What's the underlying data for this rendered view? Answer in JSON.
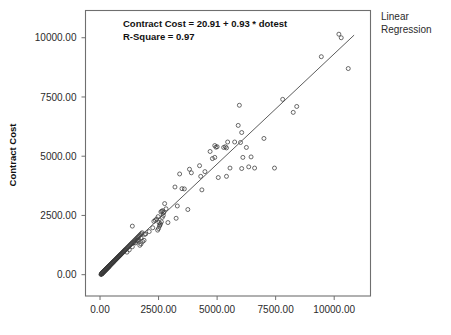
{
  "figure": {
    "background_color": "#ffffff",
    "frame_color": "#6f6f6f",
    "marker_color": "#3a3a3a",
    "line_color": "#4a4a4a"
  },
  "legend": {
    "line1": "Linear",
    "line2": "Regression"
  },
  "annotation": {
    "line1": "Contract Cost = 20.91 + 0.93 * dotest",
    "line2": "R-Square = 0.97"
  },
  "axes": {
    "y_title": "Contract Cost",
    "x_title": "",
    "y_ticks": [
      "0.00",
      "2500.00",
      "5000.00",
      "7500.00",
      "10000.00"
    ],
    "x_ticks": [
      "0.00",
      "2500.00",
      "5000.00",
      "7500.00",
      "10000.00"
    ]
  },
  "chart_data": {
    "type": "scatter",
    "title": "",
    "subtitle": "",
    "xlabel": "",
    "ylabel": "Contract Cost",
    "xlim": [
      -620,
      11550
    ],
    "ylim": [
      -900,
      11150
    ],
    "grid": false,
    "legend_position": "right-top",
    "annotations": [
      "Contract Cost = 20.91 + 0.93 * dotest",
      "R-Square = 0.97"
    ],
    "x_ticks": [
      0,
      2500,
      5000,
      7500,
      10000
    ],
    "y_ticks": [
      0,
      2500,
      5000,
      7500,
      10000
    ],
    "fit": {
      "name": "Linear Regression",
      "intercept": 20.91,
      "slope": 0.93,
      "r_square": 0.97,
      "x_start": 0,
      "x_end": 10850
    },
    "series": [
      {
        "name": "Contract Cost vs dotest",
        "marker": "open-circle",
        "x": [
          40,
          55,
          60,
          70,
          75,
          80,
          85,
          90,
          95,
          100,
          105,
          110,
          115,
          120,
          125,
          130,
          135,
          140,
          145,
          150,
          155,
          160,
          165,
          170,
          175,
          180,
          185,
          190,
          195,
          200,
          205,
          210,
          215,
          220,
          225,
          230,
          235,
          240,
          245,
          250,
          255,
          260,
          265,
          270,
          275,
          280,
          285,
          290,
          295,
          300,
          305,
          310,
          315,
          320,
          325,
          330,
          335,
          340,
          345,
          350,
          355,
          360,
          365,
          370,
          375,
          380,
          385,
          390,
          395,
          400,
          410,
          420,
          430,
          440,
          450,
          460,
          470,
          480,
          490,
          500,
          510,
          520,
          530,
          540,
          550,
          560,
          570,
          580,
          590,
          600,
          615,
          630,
          645,
          660,
          675,
          690,
          705,
          720,
          735,
          750,
          765,
          780,
          795,
          810,
          825,
          840,
          855,
          870,
          885,
          900,
          920,
          940,
          960,
          980,
          1000,
          1020,
          1040,
          1060,
          1080,
          1100,
          1130,
          1160,
          1190,
          1220,
          1250,
          1280,
          1310,
          1340,
          1370,
          1400,
          1440,
          1480,
          1520,
          1560,
          1600,
          1640,
          1680,
          1720,
          1760,
          1800,
          1380,
          1450,
          1520,
          1580,
          1650,
          1700,
          1750,
          1820,
          1880,
          1950,
          2300,
          2360,
          2420,
          2480,
          2520,
          2560,
          2600,
          2640,
          2680,
          2720,
          2460,
          2500,
          2540,
          2580,
          2620,
          2660,
          2700,
          2760,
          2820,
          2900,
          3200,
          3300,
          3400,
          3500,
          3600,
          3750,
          3820,
          3900,
          4250,
          4350,
          4480,
          4700,
          4800,
          4900,
          4950,
          5000,
          5050,
          5280,
          5350,
          5400,
          5450,
          5550,
          5900,
          5950,
          6000,
          6050,
          6100,
          6250,
          6350,
          6450,
          6600,
          7000,
          7450,
          7800,
          8250,
          8400,
          9450,
          10200,
          10300,
          10600,
          1150,
          1250,
          1380,
          1600,
          1750,
          1900,
          2100,
          2250,
          3250,
          4300,
          4900,
          5400,
          5750,
          6050
        ],
        "y": [
          10,
          20,
          25,
          35,
          40,
          45,
          50,
          60,
          65,
          70,
          75,
          80,
          85,
          90,
          95,
          100,
          105,
          110,
          115,
          120,
          125,
          130,
          135,
          140,
          145,
          150,
          155,
          160,
          165,
          170,
          175,
          180,
          185,
          190,
          195,
          200,
          205,
          210,
          215,
          220,
          225,
          230,
          235,
          240,
          245,
          250,
          255,
          260,
          265,
          270,
          275,
          280,
          285,
          290,
          295,
          300,
          305,
          310,
          315,
          320,
          325,
          330,
          335,
          340,
          345,
          350,
          355,
          360,
          365,
          370,
          380,
          390,
          400,
          410,
          420,
          430,
          440,
          450,
          460,
          470,
          480,
          490,
          500,
          510,
          520,
          530,
          540,
          550,
          560,
          570,
          585,
          600,
          615,
          630,
          645,
          660,
          675,
          690,
          705,
          720,
          735,
          750,
          765,
          780,
          795,
          810,
          825,
          840,
          855,
          870,
          890,
          910,
          930,
          950,
          970,
          990,
          1010,
          1030,
          1050,
          1070,
          1100,
          1130,
          1160,
          1190,
          1220,
          1250,
          1280,
          1310,
          1340,
          1370,
          1410,
          1450,
          1490,
          1530,
          1570,
          1610,
          1650,
          1690,
          1730,
          1770,
          2050,
          1350,
          1340,
          1420,
          1480,
          1240,
          1300,
          1400,
          1450,
          1720,
          2250,
          2300,
          2350,
          2450,
          2200,
          2100,
          2650,
          2680,
          2700,
          2620,
          1880,
          1950,
          2050,
          2150,
          2230,
          2420,
          2500,
          3000,
          2780,
          2200,
          3700,
          2900,
          4250,
          3630,
          3620,
          2750,
          4450,
          4300,
          4600,
          3580,
          4350,
          5200,
          4900,
          5450,
          5380,
          5400,
          4100,
          5370,
          5400,
          4150,
          5600,
          4500,
          6300,
          7150,
          5580,
          4480,
          4950,
          5370,
          4550,
          4970,
          4500,
          5750,
          4500,
          7400,
          6850,
          7100,
          9200,
          10150,
          10000,
          8700,
          950,
          1050,
          1180,
          1450,
          1550,
          1700,
          1820,
          1980,
          2380,
          4150,
          4950,
          5350,
          5600,
          6000
        ]
      }
    ]
  }
}
